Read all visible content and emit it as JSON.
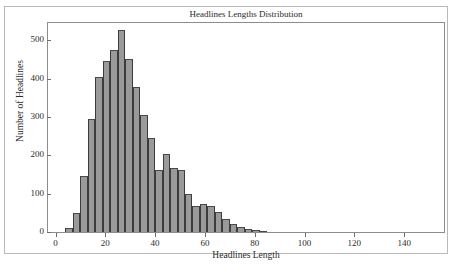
{
  "figure": {
    "title": "Headlines Lengths Distribution",
    "caption": ""
  },
  "chart_data": {
    "type": "bar",
    "title": "Headlines Lengths Distribution",
    "xlabel": "Headlines Length",
    "ylabel": "Number of Headlines",
    "xlim": [
      -3,
      156
    ],
    "ylim": [
      0,
      545
    ],
    "xticks": [
      0,
      20,
      40,
      60,
      80,
      100,
      120,
      140
    ],
    "yticks": [
      0,
      100,
      200,
      300,
      400,
      500
    ],
    "grid": false,
    "legend": null,
    "bin_width": 3,
    "bar_color": "#9a9a9a",
    "bar_edge_color": "#3c3c3c",
    "bin_starts": [
      4,
      7,
      10,
      13,
      16,
      19,
      22,
      25,
      28,
      31,
      34,
      37,
      40,
      43,
      46,
      49,
      52,
      55,
      58,
      61,
      64,
      67,
      70,
      73,
      76,
      79,
      82
    ],
    "categories": [
      "4",
      "7",
      "10",
      "13",
      "16",
      "19",
      "22",
      "25",
      "28",
      "31",
      "34",
      "37",
      "40",
      "43",
      "46",
      "49",
      "52",
      "55",
      "58",
      "61",
      "64",
      "67",
      "70",
      "73",
      "76",
      "79",
      "82"
    ],
    "values": [
      10,
      50,
      146,
      294,
      404,
      446,
      474,
      527,
      450,
      379,
      306,
      246,
      161,
      203,
      166,
      163,
      98,
      69,
      74,
      69,
      53,
      35,
      21,
      14,
      7,
      5,
      3
    ]
  }
}
